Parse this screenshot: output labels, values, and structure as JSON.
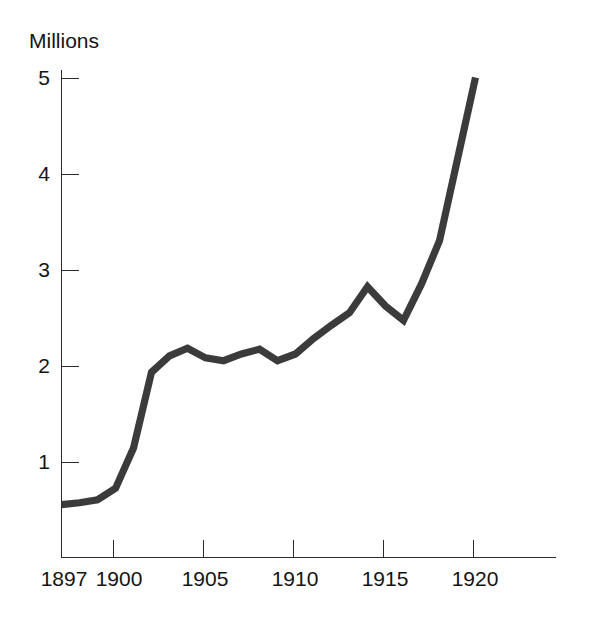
{
  "chart_data": {
    "type": "line",
    "title": "",
    "xlabel": "",
    "ylabel": "Millions",
    "ylabel_position": "top-left",
    "x": [
      1897,
      1898,
      1899,
      1900,
      1901,
      1902,
      1903,
      1904,
      1905,
      1906,
      1907,
      1908,
      1909,
      1910,
      1911,
      1912,
      1913,
      1914,
      1915,
      1916,
      1917,
      1918,
      1919,
      1920
    ],
    "values": [
      0.55,
      0.57,
      0.6,
      0.72,
      1.14,
      1.93,
      2.1,
      2.18,
      2.08,
      2.05,
      2.12,
      2.17,
      2.05,
      2.12,
      2.28,
      2.42,
      2.55,
      2.82,
      2.62,
      2.47,
      2.85,
      3.3,
      4.15,
      5.0
    ],
    "series": [
      {
        "name": "Millions",
        "values": [
          0.55,
          0.57,
          0.6,
          0.72,
          1.14,
          1.93,
          2.1,
          2.18,
          2.08,
          2.05,
          2.12,
          2.17,
          2.05,
          2.12,
          2.28,
          2.42,
          2.55,
          2.82,
          2.62,
          2.47,
          2.85,
          3.3,
          4.15,
          5.0
        ]
      }
    ],
    "xlim": [
      1897,
      1923
    ],
    "ylim": [
      0,
      5.3
    ],
    "y_ticks": [
      1,
      2,
      3,
      4,
      5
    ],
    "y_tick_labels": [
      "1",
      "2",
      "3",
      "4",
      "5"
    ],
    "x_ticks": [
      1900,
      1905,
      1910,
      1915,
      1920
    ],
    "x_tick_labels": [
      "1900",
      "1905",
      "1910",
      "1915",
      "1920"
    ],
    "x_axis_start_label": "1897",
    "grid": false,
    "legend": "none",
    "line_color": "#3b3b3b",
    "axis_color": "#2b2b2b",
    "background_color": "#ffffff"
  },
  "axis": {
    "y_title": "Millions",
    "y_tick_1": "1",
    "y_tick_2": "2",
    "y_tick_3": "3",
    "y_tick_4": "4",
    "y_tick_5": "5",
    "x_tick_1897": "1897",
    "x_tick_1900": "1900",
    "x_tick_1905": "1905",
    "x_tick_1910": "1910",
    "x_tick_1915": "1915",
    "x_tick_1920": "1920"
  }
}
